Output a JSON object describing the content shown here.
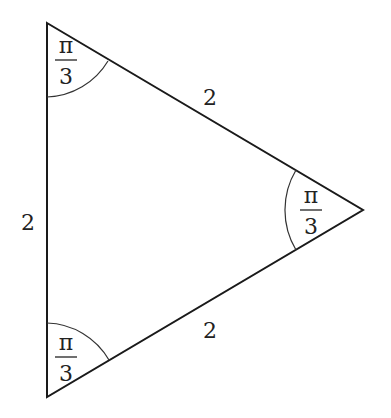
{
  "diagram": {
    "type": "equilateral-triangle",
    "vertices": {
      "top": {
        "x": 47,
        "y": 23
      },
      "right": {
        "x": 363,
        "y": 210
      },
      "bottom": {
        "x": 47,
        "y": 397
      }
    },
    "sides": {
      "left": {
        "label": "2"
      },
      "top_right": {
        "label": "2"
      },
      "bottom_right": {
        "label": "2"
      }
    },
    "angles": {
      "top": {
        "numerator": "π",
        "denominator": "3"
      },
      "right": {
        "numerator": "π",
        "denominator": "3"
      },
      "bottom": {
        "numerator": "π",
        "denominator": "3"
      }
    },
    "colors": {
      "stroke": "#1a1a1a",
      "arc": "#333333",
      "text": "#222222"
    }
  }
}
